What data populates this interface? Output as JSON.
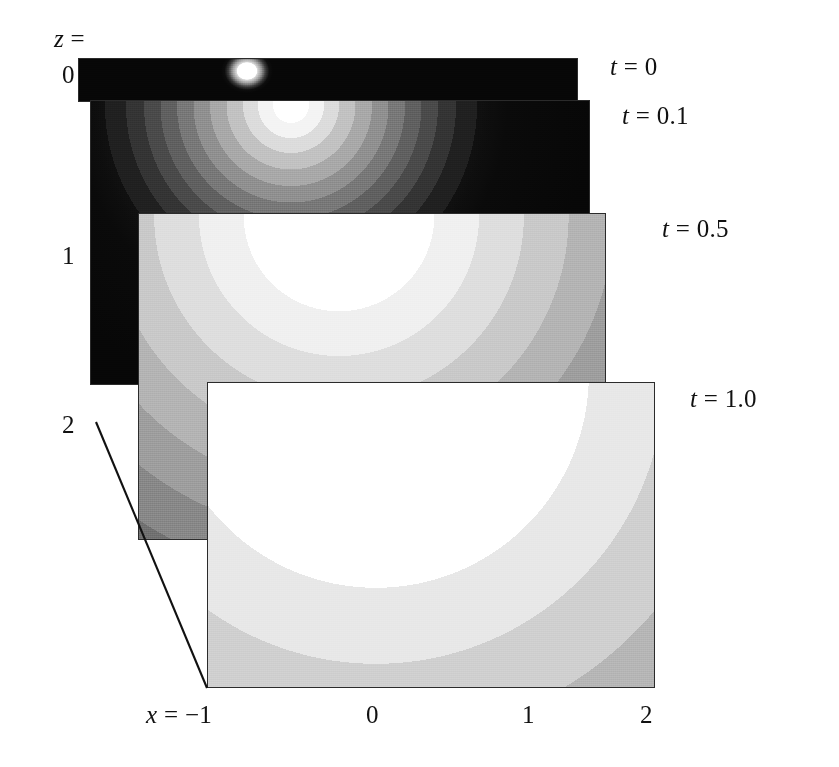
{
  "figure": {
    "type": "stacked-contour-panels",
    "background_color": "#ffffff",
    "ink_color": "#111111"
  },
  "axes": {
    "z_axis": {
      "label": "z =",
      "ticks": [
        "0",
        "1",
        "2"
      ],
      "tick_values": [
        0,
        1,
        2
      ]
    },
    "x_axis": {
      "label": "x =",
      "ticks": [
        "-1",
        "0",
        "1",
        "2"
      ],
      "tick_values": [
        -1,
        0,
        1,
        2
      ],
      "first_tick_display": "−1"
    }
  },
  "panels": [
    {
      "id": "panel-t0",
      "time_label": "t = 0",
      "time_value": 0
    },
    {
      "id": "panel-t01",
      "time_label": "t = 0.1",
      "time_value": 0.1
    },
    {
      "id": "panel-t05",
      "time_label": "t = 0.5",
      "time_value": 0.5
    },
    {
      "id": "panel-t10",
      "time_label": "t = 1.0",
      "time_value": 1.0
    }
  ],
  "chart_data": {
    "type": "heatmap",
    "title": "",
    "xlabel": "x",
    "ylabel": "z",
    "xlim": [
      -1,
      2
    ],
    "zlim": [
      0,
      2
    ],
    "grid": false,
    "legend": "none",
    "colormap": "grayscale",
    "colormap_levels": [
      "#000000",
      "#1c1c1c",
      "#343434",
      "#4b4b4b",
      "#626262",
      "#7a7a7a",
      "#949494",
      "#adadad",
      "#c6c6c6",
      "#dedede",
      "#f2f2f2",
      "#ffffff"
    ],
    "field_center": {
      "x": 0.0,
      "z": 0.0
    },
    "series": [
      {
        "name": "t = 0",
        "t": 0,
        "core_radius": 0.045,
        "band_radii": [
          0.045
        ],
        "note": "near point source, thin slab shown"
      },
      {
        "name": "t = 0.1",
        "t": 0.1,
        "core_radius": 0.16,
        "band_radii": [
          0.16,
          0.3,
          0.44,
          0.58,
          0.72,
          0.86,
          1.0,
          1.14
        ],
        "note": "narrow concentric bands, rapid falloff to black"
      },
      {
        "name": "t = 0.5",
        "t": 0.5,
        "core_radius": 0.52,
        "band_radii": [
          0.52,
          0.8,
          1.08,
          1.36,
          1.64,
          1.92,
          2.2,
          2.48
        ],
        "note": "broad bands, large bright core"
      },
      {
        "name": "t = 1.0",
        "t": 1.0,
        "core_radius": 0.95,
        "band_radii": [
          0.95,
          1.4,
          1.85,
          2.3,
          2.75,
          3.2
        ],
        "note": "widest bands, very large saturated core"
      }
    ]
  }
}
